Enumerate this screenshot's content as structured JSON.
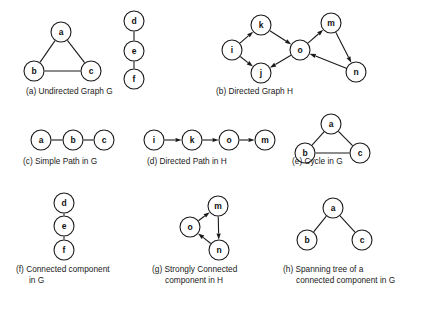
{
  "figure": {
    "width": 428,
    "height": 309,
    "background": "#ffffff",
    "ink_color": "#1a1a1a",
    "node_radius": 10,
    "panels": [
      {
        "id": "a",
        "caption": "(a) Undirected Graph G",
        "caption_lines": [
          "(a) Undirected Graph G"
        ],
        "caption_x": 26,
        "caption_y": 94,
        "directed": false,
        "nodes": [
          {
            "id": "a",
            "label": "a",
            "x": 61,
            "y": 32
          },
          {
            "id": "b",
            "label": "b",
            "x": 34,
            "y": 71
          },
          {
            "id": "c",
            "label": "c",
            "x": 91,
            "y": 71
          },
          {
            "id": "d",
            "label": "d",
            "x": 134,
            "y": 21
          },
          {
            "id": "e",
            "label": "e",
            "x": 134,
            "y": 51
          },
          {
            "id": "f",
            "label": "f",
            "x": 134,
            "y": 79
          }
        ],
        "edges": [
          {
            "from": "a",
            "to": "b"
          },
          {
            "from": "a",
            "to": "c"
          },
          {
            "from": "b",
            "to": "c"
          },
          {
            "from": "d",
            "to": "e"
          },
          {
            "from": "e",
            "to": "f"
          }
        ]
      },
      {
        "id": "b",
        "caption": "(b) Directed Graph H",
        "caption_lines": [
          "(b) Directed Graph H"
        ],
        "caption_x": 216,
        "caption_y": 94,
        "directed": true,
        "nodes": [
          {
            "id": "i",
            "label": "i",
            "x": 232,
            "y": 50
          },
          {
            "id": "k",
            "label": "k",
            "x": 261,
            "y": 25
          },
          {
            "id": "j",
            "label": "j",
            "x": 261,
            "y": 73
          },
          {
            "id": "o",
            "label": "o",
            "x": 300,
            "y": 50
          },
          {
            "id": "m",
            "label": "m",
            "x": 331,
            "y": 23
          },
          {
            "id": "n",
            "label": "n",
            "x": 356,
            "y": 72
          }
        ],
        "edges": [
          {
            "from": "i",
            "to": "k"
          },
          {
            "from": "i",
            "to": "j"
          },
          {
            "from": "k",
            "to": "o"
          },
          {
            "from": "o",
            "to": "j"
          },
          {
            "from": "o",
            "to": "m"
          },
          {
            "from": "m",
            "to": "n"
          },
          {
            "from": "n",
            "to": "o"
          }
        ]
      },
      {
        "id": "c",
        "caption": "(c) Simple Path in G",
        "caption_lines": [
          "(c) Simple Path in G"
        ],
        "caption_x": 23,
        "caption_y": 164,
        "directed": false,
        "nodes": [
          {
            "id": "a",
            "label": "a",
            "x": 41,
            "y": 140
          },
          {
            "id": "b",
            "label": "b",
            "x": 73,
            "y": 140
          },
          {
            "id": "c",
            "label": "c",
            "x": 104,
            "y": 140
          }
        ],
        "edges": [
          {
            "from": "a",
            "to": "b"
          },
          {
            "from": "b",
            "to": "c"
          }
        ]
      },
      {
        "id": "d",
        "caption": "(d) Directed Path in H",
        "caption_lines": [
          "(d) Directed Path in H"
        ],
        "caption_x": 147,
        "caption_y": 164,
        "directed": true,
        "nodes": [
          {
            "id": "i",
            "label": "i",
            "x": 154,
            "y": 140
          },
          {
            "id": "k",
            "label": "k",
            "x": 192,
            "y": 140
          },
          {
            "id": "o",
            "label": "o",
            "x": 229,
            "y": 140
          },
          {
            "id": "m",
            "label": "m",
            "x": 265,
            "y": 140
          }
        ],
        "edges": [
          {
            "from": "i",
            "to": "k"
          },
          {
            "from": "k",
            "to": "o"
          },
          {
            "from": "o",
            "to": "m"
          }
        ]
      },
      {
        "id": "e",
        "caption": "(e) Cycle in G",
        "caption_lines": [
          "(e) Cycle in G"
        ],
        "caption_x": 292,
        "caption_y": 164,
        "directed": false,
        "nodes": [
          {
            "id": "a",
            "label": "a",
            "x": 331,
            "y": 124
          },
          {
            "id": "b",
            "label": "b",
            "x": 305,
            "y": 153
          },
          {
            "id": "c",
            "label": "c",
            "x": 360,
            "y": 153
          }
        ],
        "edges": [
          {
            "from": "a",
            "to": "b"
          },
          {
            "from": "a",
            "to": "c"
          },
          {
            "from": "b",
            "to": "c"
          }
        ]
      },
      {
        "id": "f",
        "caption": "(f) Connected component in G",
        "caption_lines": [
          "(f) Connected component",
          "in G"
        ],
        "caption_x": 16,
        "caption_y": 272,
        "directed": false,
        "nodes": [
          {
            "id": "d",
            "label": "d",
            "x": 64,
            "y": 203
          },
          {
            "id": "e",
            "label": "e",
            "x": 64,
            "y": 226
          },
          {
            "id": "f",
            "label": "f",
            "x": 64,
            "y": 250
          }
        ],
        "edges": [
          {
            "from": "d",
            "to": "e"
          },
          {
            "from": "e",
            "to": "f"
          }
        ]
      },
      {
        "id": "g",
        "caption": "(g) Strongly Connected component in H",
        "caption_lines": [
          "(g) Strongly Connected",
          "component in H"
        ],
        "caption_x": 152,
        "caption_y": 272,
        "directed": true,
        "nodes": [
          {
            "id": "m",
            "label": "m",
            "x": 218,
            "y": 206
          },
          {
            "id": "o",
            "label": "o",
            "x": 190,
            "y": 227
          },
          {
            "id": "n",
            "label": "n",
            "x": 219,
            "y": 250
          }
        ],
        "edges": [
          {
            "from": "o",
            "to": "m"
          },
          {
            "from": "m",
            "to": "n"
          },
          {
            "from": "n",
            "to": "o"
          }
        ]
      },
      {
        "id": "h",
        "caption": "(h) Spanning tree of a connected component in G",
        "caption_lines": [
          "(h) Spanning tree of a",
          "connected component in G"
        ],
        "caption_x": 283,
        "caption_y": 272,
        "directed": false,
        "nodes": [
          {
            "id": "a",
            "label": "a",
            "x": 333,
            "y": 208
          },
          {
            "id": "b",
            "label": "b",
            "x": 307,
            "y": 240
          },
          {
            "id": "c",
            "label": "c",
            "x": 362,
            "y": 240
          }
        ],
        "edges": [
          {
            "from": "a",
            "to": "b"
          },
          {
            "from": "a",
            "to": "c"
          }
        ]
      }
    ]
  }
}
